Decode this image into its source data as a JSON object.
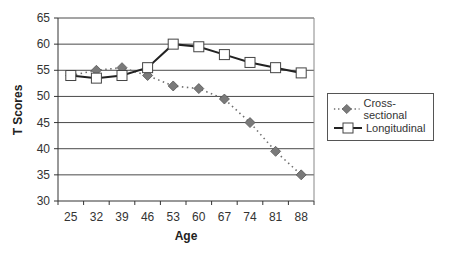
{
  "chart_data": {
    "type": "line",
    "title": "",
    "xlabel": "Age",
    "ylabel": "T Scores",
    "categories": [
      "25",
      "32",
      "39",
      "46",
      "53",
      "60",
      "67",
      "74",
      "81",
      "88"
    ],
    "ylim": [
      30,
      65
    ],
    "yticks": [
      30,
      35,
      40,
      45,
      50,
      55,
      60,
      65
    ],
    "grid": true,
    "legend_position": "right",
    "series": [
      {
        "name": "Cross-sectional",
        "marker": "diamond",
        "line_style": "dotted",
        "color": "#6e6e6e",
        "values": [
          54,
          55,
          55.5,
          54,
          52,
          51.5,
          49.5,
          45,
          39.5,
          35
        ]
      },
      {
        "name": "Longitudinal",
        "marker": "square",
        "line_style": "solid",
        "color": "#222222",
        "values": [
          54,
          53.5,
          54,
          55.5,
          60,
          59.5,
          58,
          56.5,
          55.5,
          54.5
        ]
      }
    ]
  },
  "legend": {
    "items": [
      {
        "label": "Cross-sectional"
      },
      {
        "label": "Longitudinal"
      }
    ]
  }
}
